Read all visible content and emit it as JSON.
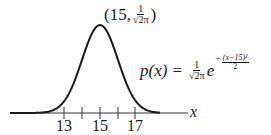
{
  "figure": {
    "axis": {
      "variable": "x",
      "tick_labels": [
        "13",
        "15",
        "17"
      ],
      "tick_values": [
        13,
        14,
        15,
        16,
        17
      ]
    },
    "peak_label": {
      "open": "(15,",
      "num": "1",
      "den": "√2π",
      "close": ")"
    },
    "formula": {
      "lhs": "p(x) =",
      "coef_num": "1",
      "coef_den": "√2π",
      "base": "e",
      "exp_sign": "−",
      "exp_num": "(x−15)²",
      "exp_den": "2"
    }
  },
  "chart_data": {
    "type": "line",
    "title": "",
    "xlabel": "x",
    "ylabel": "p(x)",
    "function": "p(x) = (1/√(2π)) e^(-(x-15)^2/2)",
    "mean": 15,
    "std": 1,
    "peak": {
      "x": 15,
      "y": "1/√(2π)",
      "y_approx": 0.3989
    },
    "x_ticks": [
      13,
      14,
      15,
      16,
      17
    ],
    "x_tick_labels": [
      "13",
      "15",
      "17"
    ],
    "xlim": [
      10,
      20
    ],
    "grid": false,
    "legend": null
  },
  "colors": {
    "curve": "#1a1a1a",
    "axis": "#333333",
    "background": "#ffffff"
  }
}
